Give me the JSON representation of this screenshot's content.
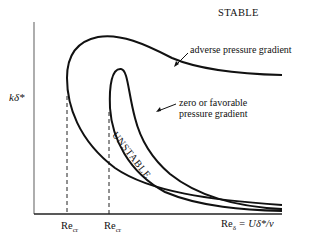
{
  "diagram": {
    "region_labels": {
      "stable": "STABLE",
      "unstable": "UNSTABLE"
    },
    "curves": [
      {
        "name": "adverse",
        "label": "adverse pressure gradient"
      },
      {
        "name": "favorable",
        "label_line1": "zero or favorable",
        "label_line2": "pressure gradient"
      }
    ],
    "axes": {
      "y_label": "kδ*",
      "x_label_base": "Re",
      "x_label_sub": "δ",
      "x_label_rest": " = Uδ*/ν"
    },
    "critical_markers": [
      {
        "base": "Re",
        "sub": "cr"
      },
      {
        "base": "Re",
        "sub": "cr"
      }
    ],
    "colors": {
      "ink": "#111111",
      "background": "#ffffff"
    }
  }
}
